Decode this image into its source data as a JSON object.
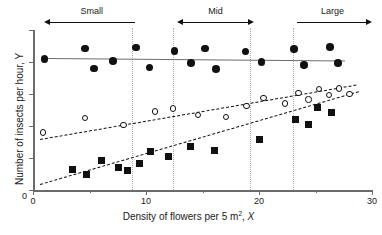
{
  "chart_data": {
    "type": "scatter",
    "title": "",
    "xlabel": "Density of flowers per 5 m2, X",
    "xlabel_prefix": "Density of flowers per 5 m",
    "xlabel_sup": "2",
    "xlabel_suffix": ", ",
    "xlabel_var": "X",
    "ylabel": "Number of insects per hour, Y",
    "xlim": [
      0,
      30
    ],
    "ylim": [
      0,
      100
    ],
    "xticks": [
      0,
      10,
      20,
      30
    ],
    "xticklabels": [
      "0",
      "10",
      "20",
      "30"
    ],
    "xminorticks": [
      5,
      15,
      25
    ],
    "yticks": [
      0,
      20,
      40,
      60,
      80,
      100
    ],
    "yticklabels": [
      "0",
      "",
      "",
      "",
      "",
      ""
    ],
    "grid": false,
    "legend": "none",
    "series": [
      {
        "name": "filled-circles",
        "marker": "filled-circle",
        "color": "#111111",
        "trendline": {
          "style": "solid",
          "color": "#6e6e6e",
          "x": [
            1.2,
            27.6
          ],
          "y": [
            82.5,
            81.0
          ]
        },
        "points": [
          {
            "x": 1.0,
            "y": 82.0
          },
          {
            "x": 4.6,
            "y": 88.5
          },
          {
            "x": 5.4,
            "y": 76.0
          },
          {
            "x": 7.1,
            "y": 80.5
          },
          {
            "x": 9.1,
            "y": 89.0
          },
          {
            "x": 10.3,
            "y": 76.5
          },
          {
            "x": 12.5,
            "y": 87.0
          },
          {
            "x": 14.0,
            "y": 79.5
          },
          {
            "x": 15.2,
            "y": 88.5
          },
          {
            "x": 16.2,
            "y": 75.5
          },
          {
            "x": 18.8,
            "y": 86.5
          },
          {
            "x": 20.2,
            "y": 80.0
          },
          {
            "x": 23.1,
            "y": 88.0
          },
          {
            "x": 24.0,
            "y": 78.0
          },
          {
            "x": 26.3,
            "y": 89.5
          },
          {
            "x": 27.0,
            "y": 79.5
          }
        ]
      },
      {
        "name": "open-circles",
        "marker": "open-circle",
        "color": "#111111",
        "trendline": {
          "style": "long-dash",
          "color": "#111111",
          "x": [
            0.6,
            28.6
          ],
          "y": [
            32.0,
            66.0
          ]
        },
        "points": [
          {
            "x": 0.9,
            "y": 36.0
          },
          {
            "x": 4.6,
            "y": 45.0
          },
          {
            "x": 8.0,
            "y": 40.5
          },
          {
            "x": 10.8,
            "y": 49.0
          },
          {
            "x": 12.4,
            "y": 51.0
          },
          {
            "x": 14.6,
            "y": 47.0
          },
          {
            "x": 17.1,
            "y": 45.5
          },
          {
            "x": 18.9,
            "y": 52.5
          },
          {
            "x": 20.4,
            "y": 57.5
          },
          {
            "x": 22.3,
            "y": 54.0
          },
          {
            "x": 23.5,
            "y": 60.5
          },
          {
            "x": 24.4,
            "y": 56.5
          },
          {
            "x": 25.3,
            "y": 63.0
          },
          {
            "x": 26.2,
            "y": 59.5
          },
          {
            "x": 27.1,
            "y": 63.5
          },
          {
            "x": 28.0,
            "y": 60.0
          }
        ]
      },
      {
        "name": "filled-squares",
        "marker": "filled-square",
        "color": "#111111",
        "trendline": {
          "style": "short-dash",
          "color": "#111111",
          "x": [
            0.6,
            28.8
          ],
          "y": [
            4.0,
            62.0
          ]
        },
        "points": [
          {
            "x": 3.5,
            "y": 13.0
          },
          {
            "x": 4.7,
            "y": 9.5
          },
          {
            "x": 6.1,
            "y": 18.5
          },
          {
            "x": 7.6,
            "y": 14.0
          },
          {
            "x": 8.4,
            "y": 12.0
          },
          {
            "x": 9.4,
            "y": 16.5
          },
          {
            "x": 10.4,
            "y": 24.0
          },
          {
            "x": 12.0,
            "y": 21.0
          },
          {
            "x": 13.9,
            "y": 27.5
          },
          {
            "x": 16.1,
            "y": 24.5
          },
          {
            "x": 20.0,
            "y": 31.5
          },
          {
            "x": 23.2,
            "y": 44.0
          },
          {
            "x": 24.4,
            "y": 41.0
          },
          {
            "x": 25.2,
            "y": 51.5
          },
          {
            "x": 26.4,
            "y": 48.5
          }
        ]
      }
    ],
    "regions": [
      {
        "label": "Small",
        "arrow": "left",
        "x_start": 1.4,
        "x_end": 9.0
      },
      {
        "label": "Mid",
        "arrow": "both",
        "x_start": 13.2,
        "x_end": 19.1
      },
      {
        "label": "Large",
        "arrow": "right",
        "x_start": 23.4,
        "x_end": 29.6
      }
    ],
    "dividers": [
      8.8,
      12.4,
      19.2,
      23.0
    ],
    "divider_color": "#b9a9a9"
  }
}
